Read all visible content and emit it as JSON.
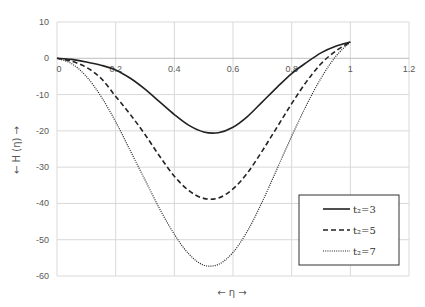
{
  "chart_data": {
    "type": "line",
    "title": "",
    "xlabel": "← η →",
    "ylabel": "← H (η) →",
    "xlim": [
      0,
      1.2
    ],
    "ylim": [
      -60,
      10
    ],
    "xticks": [
      0,
      0.2,
      0.4,
      0.6,
      0.8,
      1,
      1.2
    ],
    "xtick_labels": [
      "0",
      "0.2",
      "0.4",
      "0.6",
      "0.8",
      "1",
      "1.2"
    ],
    "yticks": [
      10,
      0,
      -10,
      -20,
      -30,
      -40,
      -50,
      -60
    ],
    "ytick_labels": [
      "10",
      "0",
      "-10",
      "-20",
      "-30",
      "-40",
      "-50",
      "-60"
    ],
    "grid": true,
    "legend_position": "lower right",
    "x": [
      0,
      0.05,
      0.1,
      0.15,
      0.2,
      0.25,
      0.3,
      0.35,
      0.4,
      0.45,
      0.5,
      0.55,
      0.6,
      0.65,
      0.7,
      0.75,
      0.8,
      0.85,
      0.9,
      0.95,
      1.0
    ],
    "series": [
      {
        "name": "t₂=3",
        "style": "solid",
        "values": [
          0,
          -0.3,
          -1.0,
          -1.9,
          -3.2,
          -5.5,
          -8.5,
          -12.0,
          -15.5,
          -18.5,
          -20.3,
          -20.5,
          -19.0,
          -16.0,
          -12.0,
          -8.0,
          -4.2,
          -1.2,
          1.5,
          3.3,
          4.5
        ]
      },
      {
        "name": "t₂=5",
        "style": "dashed",
        "values": [
          0,
          -0.8,
          -2.5,
          -5.5,
          -10.5,
          -15.5,
          -21.0,
          -27.0,
          -32.5,
          -36.5,
          -38.6,
          -38.5,
          -36.0,
          -31.5,
          -25.5,
          -19.0,
          -12.5,
          -6.5,
          -1.5,
          2.0,
          4.5
        ]
      },
      {
        "name": "t₂=7",
        "style": "dotted",
        "values": [
          0,
          -1.5,
          -5.0,
          -10.5,
          -17.5,
          -25.5,
          -33.5,
          -41.5,
          -48.5,
          -54.0,
          -57.0,
          -56.8,
          -53.5,
          -47.5,
          -39.5,
          -30.5,
          -21.5,
          -13.0,
          -5.5,
          0.5,
          4.5
        ]
      }
    ]
  },
  "legend": {
    "items": [
      {
        "label": "t₂=3",
        "style": "solid"
      },
      {
        "label": "t₂=5",
        "style": "dashed"
      },
      {
        "label": "t₂=7",
        "style": "dotted"
      }
    ]
  },
  "axes": {
    "xlabel": "← η →",
    "ylabel": "← H (η) →"
  }
}
